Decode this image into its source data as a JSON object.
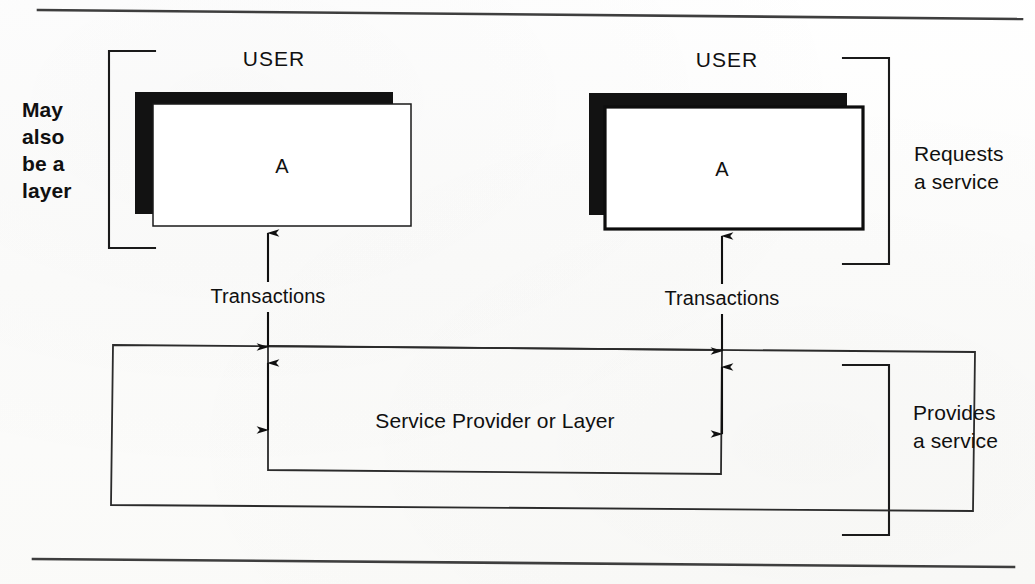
{
  "figure": {
    "ink_color": "#101010",
    "paper_color": "#fdfdfc",
    "shadow_color": "#111111"
  },
  "rules": {
    "top_rule": "horizontal-rule",
    "bottom_rule": "horizontal-rule"
  },
  "annotations": {
    "left": {
      "line1": "May",
      "line2": "also",
      "line3": "be a",
      "line4": "layer",
      "bracket": "left-brace"
    },
    "right_top": {
      "line1": "Requests",
      "line2": "a service",
      "bracket": "right-brace"
    },
    "right_bottom": {
      "line1": "Provides",
      "line2": "a service",
      "bracket": "right-brace"
    }
  },
  "users": [
    {
      "id": "user-left",
      "title": "USER",
      "entity": "A",
      "border": "thin",
      "has_shadow": true
    },
    {
      "id": "user-right",
      "title": "USER",
      "entity": "A",
      "border": "thick",
      "has_shadow": true
    }
  ],
  "connectors": [
    {
      "id": "transactions-left",
      "label": "Transactions",
      "direction": "bidirectional"
    },
    {
      "id": "transactions-right",
      "label": "Transactions",
      "direction": "bidirectional"
    }
  ],
  "provider": {
    "label": "Service Provider or Layer",
    "outer_box": "service-provider-outer",
    "inner_box": "service-provider-inner"
  }
}
